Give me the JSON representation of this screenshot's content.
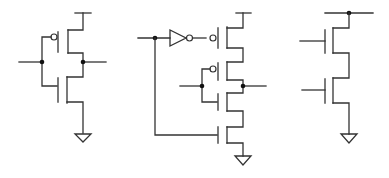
{
  "diagram": {
    "type": "cmos-transistor-schematics",
    "colors": {
      "wire": "#333333",
      "node": "#111111",
      "background": "#ffffff"
    },
    "circuits": [
      {
        "id": "inverter",
        "description": "CMOS inverter: one PMOS pull-up, one NMOS pull-down, shared input, output node",
        "components": [
          "vdd-rail",
          "pmos",
          "nmos",
          "ground"
        ]
      },
      {
        "id": "nand-with-inverted-input",
        "description": "Two series PMOS and two series NMOS; top PMOS gate driven through an inverter from first input, which also drives bottom NMOS",
        "components": [
          "vdd-rail",
          "inverter",
          "pmos",
          "pmos",
          "nmos",
          "nmos",
          "ground"
        ]
      },
      {
        "id": "nmos-stack",
        "description": "Two series NMOS transistors from a top node rail to ground",
        "components": [
          "rail",
          "nmos",
          "nmos",
          "ground"
        ]
      }
    ]
  }
}
